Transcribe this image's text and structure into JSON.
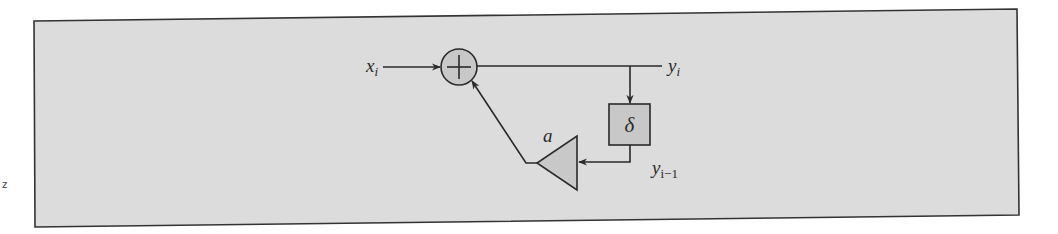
{
  "figure": {
    "type": "block-diagram",
    "colors": {
      "panel_fill": "#dcdcdc",
      "panel_border": "#333333",
      "block_fill": "#c8c8c8",
      "line": "#2a2a2a",
      "page_bg": "#ffffff"
    }
  },
  "nodes": {
    "input": {
      "label": "x",
      "subscript": "i"
    },
    "adder": {
      "symbol": "+",
      "role": "summing junction"
    },
    "output": {
      "label": "y",
      "subscript": "i"
    },
    "delay": {
      "symbol": "δ",
      "role": "unit delay"
    },
    "delayed_output": {
      "label": "y",
      "subscript": "i−1"
    },
    "gain": {
      "label": "a",
      "role": "multiplier"
    }
  },
  "edges": [
    {
      "from": "input",
      "to": "adder"
    },
    {
      "from": "adder",
      "to": "output"
    },
    {
      "from": "output",
      "to": "delay"
    },
    {
      "from": "delay",
      "to": "gain"
    },
    {
      "from": "gain",
      "to": "adder"
    }
  ],
  "margin_mark": "z"
}
